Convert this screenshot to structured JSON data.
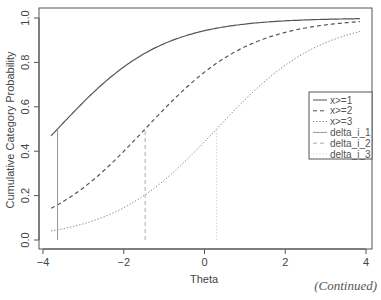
{
  "chart_data": {
    "type": "line",
    "title": "",
    "xlabel": "Theta",
    "ylabel": "Cumulative Category Probability",
    "xlim": [
      -4,
      4
    ],
    "ylim": [
      0,
      1
    ],
    "x_ticks": [
      -4,
      -2,
      0,
      2,
      4
    ],
    "x_tick_labels": [
      "−4",
      "−2",
      "0",
      "2",
      "4"
    ],
    "y_ticks": [
      0.0,
      0.2,
      0.4,
      0.6,
      0.8,
      1.0
    ],
    "y_tick_labels": [
      "0.0",
      "0.2",
      "0.4",
      "0.6",
      "0.8",
      "1.0"
    ],
    "grid": false,
    "legend_position": "right",
    "theta_range": [
      -3.8,
      3.85
    ],
    "series": [
      {
        "name": "x>=1",
        "style": "solid",
        "color": "#555555",
        "slope": 0.77,
        "location": -3.64,
        "x": [
          -3.8,
          -3,
          -2,
          -1,
          0,
          1,
          2,
          3,
          3.85
        ],
        "values": [
          0.47,
          0.62,
          0.79,
          0.89,
          0.94,
          0.98,
          0.99,
          1.0,
          1.0
        ]
      },
      {
        "name": "x>=2",
        "style": "dashed",
        "color": "#555555",
        "slope": 0.77,
        "location": -1.47,
        "x": [
          -3.8,
          -3,
          -2,
          -1,
          0,
          1,
          2,
          3,
          3.85
        ],
        "values": [
          0.14,
          0.24,
          0.4,
          0.59,
          0.76,
          0.87,
          0.94,
          0.97,
          0.985
        ]
      },
      {
        "name": "x>=3",
        "style": "dotted",
        "color": "#777777",
        "slope": 0.77,
        "location": 0.3,
        "x": [
          -3.8,
          -3,
          -2,
          -1,
          0,
          1,
          2,
          3,
          3.85
        ],
        "values": [
          0.04,
          0.07,
          0.15,
          0.27,
          0.44,
          0.63,
          0.79,
          0.88,
          0.94
        ]
      },
      {
        "name": "delta_i_1",
        "style": "solid-vline",
        "color": "#999999",
        "x": -3.64,
        "y_top": 0.5
      },
      {
        "name": "delta_i_2",
        "style": "dashed-vline",
        "color": "#aaaaaa",
        "x": -1.47,
        "y_top": 0.5
      },
      {
        "name": "delta_i_3",
        "style": "dotted-vline",
        "color": "#cccccc",
        "x": 0.3,
        "y_top": 0.5
      }
    ]
  },
  "footer": {
    "continued": "(Continued)"
  }
}
